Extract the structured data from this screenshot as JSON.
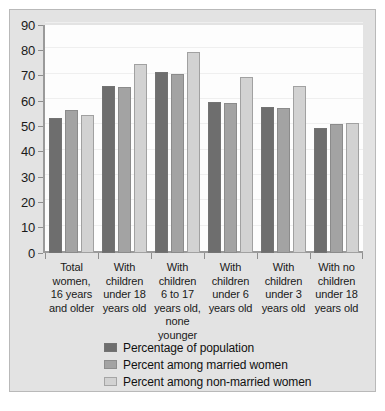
{
  "chart_data": {
    "type": "bar",
    "title": "",
    "xlabel": "",
    "ylabel": "",
    "ylim": [
      0,
      90
    ],
    "yticks": [
      0,
      10,
      20,
      30,
      40,
      50,
      60,
      70,
      80,
      90
    ],
    "grid": true,
    "legend_position": "bottom",
    "categories": [
      "Total women, 16 years and older",
      "With children under 18 years old",
      "With children 6 to 17 years old, none younger",
      "With children under 6 years old",
      "With children under 3 years old",
      "With no children under 18 years old"
    ],
    "category_lines": [
      [
        "Total",
        "women,",
        "16 years",
        "and older"
      ],
      [
        "With",
        "children",
        "under 18",
        "years old"
      ],
      [
        "With",
        "children",
        "6 to 17",
        "years old,",
        "none",
        "younger"
      ],
      [
        "With",
        "children",
        "under 6",
        "years old"
      ],
      [
        "With",
        "children",
        "under 3",
        "years old"
      ],
      [
        "With no",
        "children",
        "under 18",
        "years old"
      ]
    ],
    "series": [
      {
        "name": "Percentage of population",
        "color": "#6e6e6e",
        "values": [
          53.2,
          66.0,
          71.4,
          59.8,
          57.5,
          49.2
        ]
      },
      {
        "name": "Percent among married women",
        "color": "#a3a3a3",
        "values": [
          56.4,
          65.6,
          70.6,
          59.2,
          57.4,
          50.9
        ]
      },
      {
        "name": "Percent among non-married women",
        "color": "#d2d2d2",
        "values": [
          54.5,
          74.6,
          79.3,
          69.6,
          65.9,
          51.3
        ]
      }
    ]
  },
  "legend": {
    "items": [
      {
        "label": "Percentage of population",
        "series": 0
      },
      {
        "label": "Percent among married women",
        "series": 1
      },
      {
        "label": "Percent among non-married women",
        "series": 2
      }
    ]
  },
  "colors": {
    "series_dark": "#6e6e6e",
    "series_mid": "#a3a3a3",
    "series_light": "#d2d2d2",
    "panel_background": "#e3e3e3",
    "plot_background": "#fdfdfd",
    "axis": "#9a9a9a"
  }
}
